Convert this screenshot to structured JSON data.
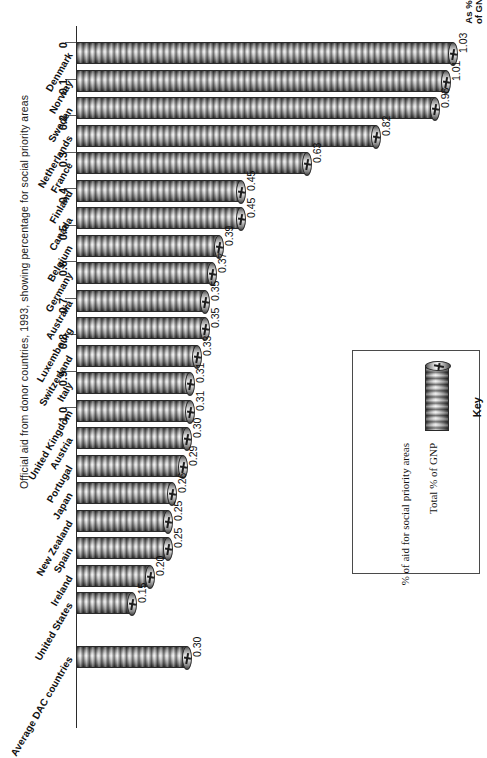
{
  "caption": "Official aid from donor countries, 1993, showing percentage for social priority areas",
  "axis": {
    "title_line1": "As %",
    "title_line2": "of GNP",
    "ticks": [
      "0",
      "0.1",
      "0.2",
      "0.3",
      "0.4",
      "0.5",
      "0.6",
      "0.7",
      "0.8",
      "0.9",
      "1.0"
    ]
  },
  "key": {
    "title": "Key",
    "entry_total": "Total % of GNP",
    "entry_social": "% of aid for social priority areas"
  },
  "chart_data": {
    "type": "bar",
    "title": "Official aid from donor countries, 1993, showing percentage for social priority areas",
    "xlabel": "As % of GNP",
    "ylabel": "",
    "orientation": "horizontal",
    "xlim": [
      0,
      1.1
    ],
    "grid": false,
    "legend_position": "right",
    "legend": [
      "Total % of GNP",
      "% of aid for social priority areas"
    ],
    "categories": [
      "Denmark",
      "Norway",
      "Sweden",
      "Netherlands",
      "France",
      "Finland",
      "Canada",
      "Belgium",
      "Germany",
      "Australia",
      "Luxembourg",
      "Switzerland",
      "Italy",
      "United Kingdom",
      "Austria",
      "Portugal",
      "Japan",
      "New Zealand",
      "Spain",
      "Ireland",
      "United States",
      "Average DAC countries"
    ],
    "values": [
      1.03,
      1.01,
      0.98,
      0.82,
      0.63,
      0.45,
      0.45,
      0.39,
      0.37,
      0.35,
      0.35,
      0.33,
      0.31,
      0.31,
      0.3,
      0.29,
      0.26,
      0.25,
      0.25,
      0.2,
      0.15,
      0.3
    ],
    "value_labels": [
      "1.03",
      "1.01",
      "0.98",
      "0.82",
      "0.63",
      "0.45",
      "0.45",
      "0.39",
      "0.37",
      "0.35",
      "0.35",
      "0.33",
      "0.31",
      "0.31",
      "0.30",
      "0.29",
      "0.26",
      "0.25",
      "0.25",
      "0.20",
      "0.15",
      "0.30"
    ]
  },
  "colors": {
    "bar_dark": "#3f3f3f",
    "bar_light": "#f2f2f2",
    "axis": "#2b2b2b",
    "text": "#111111",
    "key_border": "#4a4a4a"
  }
}
